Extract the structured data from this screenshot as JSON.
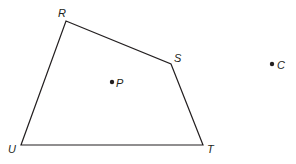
{
  "diagram": {
    "type": "geometry-figure",
    "colors": {
      "stroke": "#231f20",
      "background": "#ffffff"
    },
    "quadrilateral": {
      "name": "RSTU",
      "vertices": [
        {
          "id": "R",
          "label": "R",
          "x": 66,
          "y": 21,
          "label_x": 58,
          "label_y": 17
        },
        {
          "id": "S",
          "label": "S",
          "x": 171,
          "y": 64,
          "label_x": 174,
          "label_y": 62
        },
        {
          "id": "T",
          "label": "T",
          "x": 203,
          "y": 145,
          "label_x": 207,
          "label_y": 153
        },
        {
          "id": "U",
          "label": "U",
          "x": 21,
          "y": 145,
          "label_x": 8,
          "label_y": 153
        }
      ]
    },
    "points": [
      {
        "id": "P",
        "label": "P",
        "x": 112,
        "y": 82,
        "label_x": 116,
        "label_y": 87
      },
      {
        "id": "C",
        "label": "C",
        "x": 272,
        "y": 64,
        "label_x": 277,
        "label_y": 69
      }
    ]
  }
}
